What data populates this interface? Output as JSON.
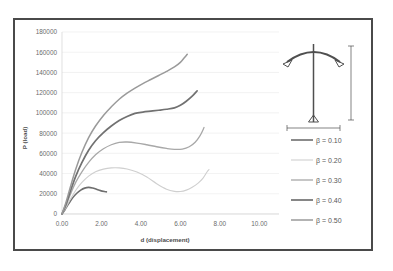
{
  "chart_data": {
    "type": "line",
    "title": "",
    "xlabel": "d (displacement)",
    "ylabel": "P (load)",
    "xlim": [
      0,
      11.0
    ],
    "ylim": [
      0,
      180000
    ],
    "xticks": [
      "0.00",
      "2.00",
      "4.00",
      "6.00",
      "8.00",
      "10.00"
    ],
    "xtick_values": [
      0,
      2,
      4,
      6,
      8,
      10
    ],
    "yticks": [
      "0",
      "20000",
      "40000",
      "60000",
      "80000",
      "100000",
      "120000",
      "140000",
      "160000",
      "180000"
    ],
    "ytick_values": [
      0,
      20000,
      40000,
      60000,
      80000,
      100000,
      120000,
      140000,
      160000,
      180000
    ],
    "grid": "horizontal",
    "legend_position": "right",
    "series": [
      {
        "name": "β = 0.10",
        "color": "#6e6e6e",
        "width": 1.6,
        "points": [
          [
            0,
            0
          ],
          [
            0.15,
            4200
          ],
          [
            0.35,
            10500
          ],
          [
            0.55,
            16200
          ],
          [
            0.75,
            20500
          ],
          [
            0.95,
            23600
          ],
          [
            1.15,
            25600
          ],
          [
            1.35,
            26300
          ],
          [
            1.55,
            25700
          ],
          [
            1.75,
            24400
          ],
          [
            1.95,
            23100
          ],
          [
            2.15,
            22200
          ],
          [
            2.25,
            21900
          ]
        ]
      },
      {
        "name": "β = 0.20",
        "color": "#cfcfcf",
        "width": 1.1,
        "points": [
          [
            0,
            0
          ],
          [
            0.2,
            6500
          ],
          [
            0.45,
            15500
          ],
          [
            0.7,
            23500
          ],
          [
            1.0,
            31000
          ],
          [
            1.35,
            37500
          ],
          [
            1.7,
            41800
          ],
          [
            2.1,
            44400
          ],
          [
            2.5,
            45600
          ],
          [
            2.9,
            45600
          ],
          [
            3.3,
            44500
          ],
          [
            3.8,
            41500
          ],
          [
            4.3,
            36500
          ],
          [
            4.8,
            30000
          ],
          [
            5.3,
            24600
          ],
          [
            5.7,
            22400
          ],
          [
            6.0,
            22200
          ],
          [
            6.3,
            23600
          ],
          [
            6.6,
            26500
          ],
          [
            6.9,
            30500
          ],
          [
            7.15,
            35500
          ],
          [
            7.35,
            41500
          ],
          [
            7.45,
            44000
          ]
        ]
      },
      {
        "name": "β = 0.30",
        "color": "#a8a8a8",
        "width": 1.3,
        "points": [
          [
            0,
            0
          ],
          [
            0.2,
            8500
          ],
          [
            0.45,
            20500
          ],
          [
            0.7,
            31500
          ],
          [
            1.0,
            41500
          ],
          [
            1.35,
            51000
          ],
          [
            1.7,
            58500
          ],
          [
            2.1,
            64500
          ],
          [
            2.5,
            68500
          ],
          [
            2.9,
            70800
          ],
          [
            3.3,
            71200
          ],
          [
            3.8,
            70200
          ],
          [
            4.3,
            68500
          ],
          [
            4.8,
            66500
          ],
          [
            5.3,
            64800
          ],
          [
            5.7,
            63900
          ],
          [
            6.1,
            64200
          ],
          [
            6.45,
            66500
          ],
          [
            6.75,
            71000
          ],
          [
            7.0,
            77500
          ],
          [
            7.2,
            85500
          ]
        ]
      },
      {
        "name": "β = 0.40",
        "color": "#717171",
        "width": 1.7,
        "points": [
          [
            0,
            0
          ],
          [
            0.2,
            9500
          ],
          [
            0.45,
            24000
          ],
          [
            0.7,
            37500
          ],
          [
            1.0,
            50500
          ],
          [
            1.35,
            63000
          ],
          [
            1.7,
            72500
          ],
          [
            2.1,
            80500
          ],
          [
            2.5,
            87000
          ],
          [
            2.9,
            92500
          ],
          [
            3.3,
            96500
          ],
          [
            3.7,
            99500
          ],
          [
            4.1,
            100800
          ],
          [
            4.5,
            101700
          ],
          [
            4.9,
            102600
          ],
          [
            5.3,
            103600
          ],
          [
            5.7,
            105000
          ],
          [
            6.0,
            107500
          ],
          [
            6.3,
            111500
          ],
          [
            6.6,
            116500
          ],
          [
            6.85,
            121800
          ]
        ]
      },
      {
        "name": "β = 0.50",
        "color": "#9a9a9a",
        "width": 1.5,
        "points": [
          [
            0,
            0
          ],
          [
            0.2,
            11500
          ],
          [
            0.45,
            28500
          ],
          [
            0.7,
            44500
          ],
          [
            1.0,
            60500
          ],
          [
            1.35,
            75500
          ],
          [
            1.7,
            87000
          ],
          [
            2.1,
            97500
          ],
          [
            2.5,
            106000
          ],
          [
            2.9,
            113500
          ],
          [
            3.3,
            119500
          ],
          [
            3.7,
            124500
          ],
          [
            4.1,
            129000
          ],
          [
            4.5,
            133000
          ],
          [
            4.9,
            137000
          ],
          [
            5.3,
            141000
          ],
          [
            5.7,
            145500
          ],
          [
            6.0,
            150000
          ],
          [
            6.2,
            154500
          ],
          [
            6.35,
            158000
          ]
        ]
      }
    ]
  },
  "inset": {
    "name": "structural-frame-diagram"
  }
}
